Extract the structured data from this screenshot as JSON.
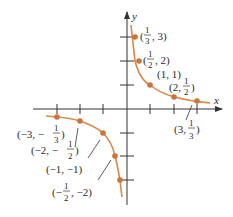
{
  "diagram": {
    "type": "graph",
    "function": "y = 1/x",
    "axes": {
      "x_label": "x",
      "y_label": "y"
    },
    "colors": {
      "curve": "#d9874a",
      "point": "#c8743a",
      "axis": "#333333"
    },
    "points": [
      {
        "x": 0.3333,
        "y": 3,
        "label": "(1/3, 3)"
      },
      {
        "x": 0.5,
        "y": 2,
        "label": "(1/2, 2)"
      },
      {
        "x": 1,
        "y": 1,
        "label": "(1, 1)"
      },
      {
        "x": 2,
        "y": 0.5,
        "label": "(2, 1/2)"
      },
      {
        "x": 3,
        "y": 0.3333,
        "label": "(3, 1/3)"
      },
      {
        "x": -3,
        "y": -0.3333,
        "label": "(-3, -1/3)"
      },
      {
        "x": -2,
        "y": -0.5,
        "label": "(-2, -1/2)"
      },
      {
        "x": -1,
        "y": -1,
        "label": "(-1, -1)"
      },
      {
        "x": -0.5,
        "y": -2,
        "label": "(-1/2, -2)"
      }
    ],
    "labels": {
      "p1": {
        "pre": "(",
        "num": "1",
        "den": "3",
        "post": ", 3)"
      },
      "p2": {
        "pre": "(",
        "num": "1",
        "den": "2",
        "post": ", 2)"
      },
      "p3": "(1, 1)",
      "p4": {
        "pre": "(2, ",
        "num": "1",
        "den": "2",
        "post": ")"
      },
      "p5": {
        "pre": "(3, ",
        "num": "1",
        "den": "3",
        "post": ")"
      },
      "p6": {
        "pre": "(−3, −",
        "num": "1",
        "den": "3",
        "post": ")"
      },
      "p7": {
        "pre": "(−2, −",
        "num": "1",
        "den": "2",
        "post": ")"
      },
      "p8": "(−1, −1)",
      "p9": {
        "pre": "(−",
        "num": "1",
        "den": "2",
        "post": ", −2)"
      }
    }
  }
}
